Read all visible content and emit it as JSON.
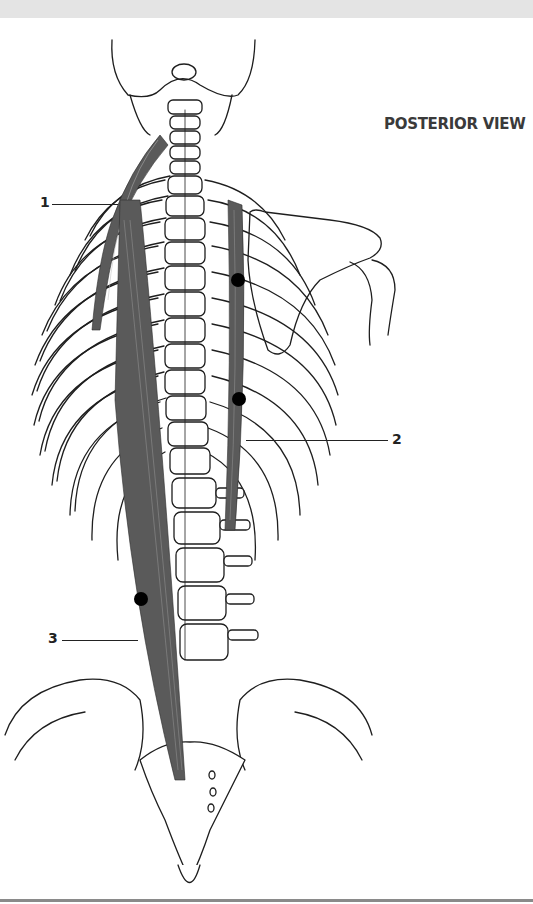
{
  "figure": {
    "view_title": "POSTERIOR VIEW",
    "labels": [
      {
        "id": "1",
        "text": "1"
      },
      {
        "id": "2",
        "text": "2"
      },
      {
        "id": "3",
        "text": "3"
      }
    ],
    "colors": {
      "muscle": "#5a5a5a",
      "bone_outline": "#1e1e1e",
      "bone_fill": "#ffffff",
      "marker": "#000000",
      "header_band": "#e4e4e4",
      "rule": "#8a8a8a"
    },
    "structures": [
      "skull-base",
      "cervical-spine",
      "thoracic-spine",
      "rib-cage",
      "right-scapula",
      "right-humerus",
      "lumbar-spine",
      "pelvis",
      "sacrum",
      "coccyx"
    ],
    "muscles": [
      "muscle-1-neck-upper-back",
      "muscle-2-right-paraspinal",
      "muscle-3-left-long-paraspinal"
    ],
    "markers": 3
  }
}
